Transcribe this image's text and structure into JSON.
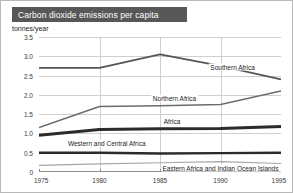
{
  "title": "Carbon dioxide emissions per capita",
  "y_unit": "tonnes/year",
  "chart_data": {
    "type": "line",
    "title": "Carbon dioxide emissions per capita",
    "xlabel": "",
    "ylabel": "tonnes/year",
    "x": [
      1975,
      1980,
      1985,
      1990,
      1995
    ],
    "categories": [
      "1975",
      "1980",
      "1985",
      "1990",
      "1995"
    ],
    "xlim": [
      1975,
      1995
    ],
    "ylim": [
      0,
      3.5
    ],
    "yticks": [
      "3.5",
      "3.0",
      "2.5",
      "2.0",
      "1.5",
      "1.0",
      "0.5",
      "0"
    ],
    "ytick_values": [
      3.5,
      3.0,
      2.5,
      2.0,
      1.5,
      1.0,
      0.5,
      0
    ],
    "grid": true,
    "legend": "inline-labels",
    "series": [
      {
        "name": "Southern Africa",
        "values": [
          2.7,
          2.7,
          3.05,
          2.75,
          2.4
        ],
        "color": "#555555",
        "width": 1.8,
        "label_x": 1991.0,
        "label_y": 2.72
      },
      {
        "name": "Northern Africa",
        "values": [
          1.15,
          1.7,
          1.72,
          1.75,
          2.1
        ],
        "color": "#6b6b6b",
        "width": 1.5,
        "label_x": 1986.2,
        "label_y": 1.92
      },
      {
        "name": "Africa",
        "values": [
          0.95,
          1.1,
          1.12,
          1.13,
          1.18
        ],
        "color": "#2b2b2b",
        "width": 3.0,
        "label_x": 1986.0,
        "label_y": 1.33
      },
      {
        "name": "Western and Central Africa",
        "values": [
          0.5,
          0.5,
          0.48,
          0.49,
          0.5
        ],
        "color": "#2b2b2b",
        "width": 2.4,
        "label_x": 1980.6,
        "label_y": 0.74
      },
      {
        "name": "Eastern Africa and Indian Ocean Islands",
        "values": [
          0.17,
          0.21,
          0.24,
          0.27,
          0.22
        ],
        "color": "#a6a6a6",
        "width": 1.2,
        "label_x": 1990.0,
        "label_y": 0.1
      }
    ]
  }
}
